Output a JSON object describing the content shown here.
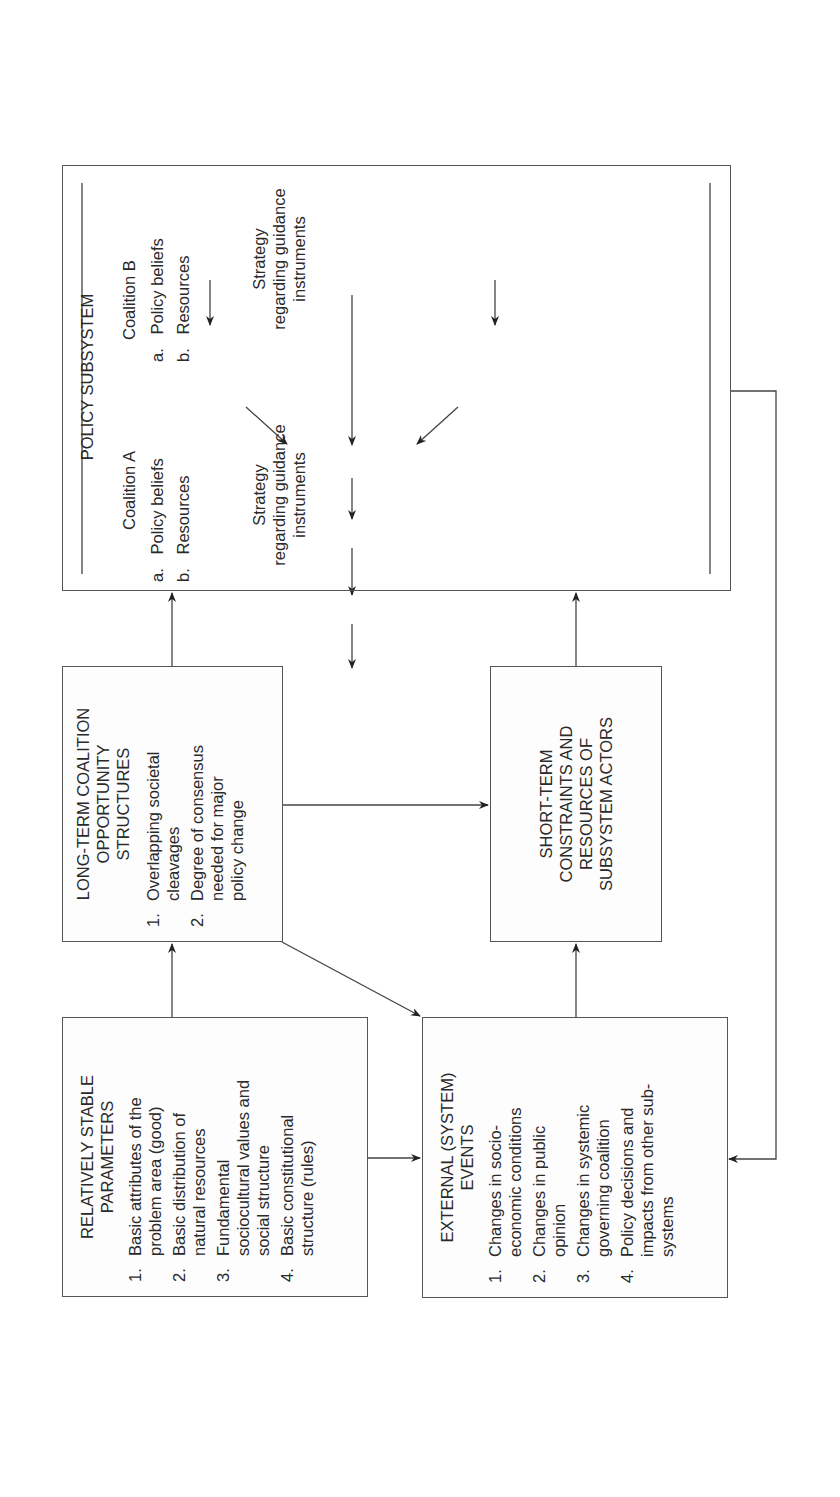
{
  "caption": "2007 Advocacy Coalition Framework Flow Diagram",
  "boxes": {
    "relatively_stable": {
      "title": [
        "RELATIVELY STABLE",
        "PARAMETERS"
      ],
      "items": [
        {
          "num": "1.",
          "lines": [
            "Basic attributes of the",
            "problem area (good)"
          ]
        },
        {
          "num": "2.",
          "lines": [
            "Basic distribution of",
            "natural resources"
          ]
        },
        {
          "num": "3.",
          "lines": [
            "Fundamental",
            "sociocultural values and",
            "social structure"
          ]
        },
        {
          "num": "4.",
          "lines": [
            "Basic constitutional",
            "structure (rules)"
          ]
        }
      ]
    },
    "long_term": {
      "title": [
        "LONG-TERM COALITION",
        "OPPORTUNITY",
        "STRUCTURES"
      ],
      "items": [
        {
          "num": "1.",
          "lines": [
            "Overlapping societal",
            "cleavages"
          ]
        },
        {
          "num": "2.",
          "lines": [
            "Degree of consensus",
            "needed for major",
            "policy change"
          ]
        }
      ]
    },
    "external_events": {
      "title": [
        "EXTERNAL (SYSTEM)",
        "EVENTS"
      ],
      "items": [
        {
          "num": "1.",
          "lines": [
            "Changes in socio-",
            "economic conditions"
          ]
        },
        {
          "num": "2.",
          "lines": [
            "Changes in public",
            "opinion"
          ]
        },
        {
          "num": "3.",
          "lines": [
            "Changes in systemic",
            "governing coalition"
          ]
        },
        {
          "num": "4.",
          "lines": [
            "Policy decisions and",
            "impacts from other sub-",
            "systems"
          ]
        }
      ]
    },
    "short_term": {
      "title": [
        "SHORT-TERM",
        "CONSTRAINTS AND",
        "RESOURCES OF",
        "SUBSYSTEM ACTORS"
      ]
    },
    "policy_subsystem": {
      "title": "POLICY SUBSYSTEM",
      "coalition_a": {
        "label": "Coalition A",
        "items": [
          {
            "num": "a.",
            "text": "Policy beliefs"
          },
          {
            "num": "b.",
            "text": "Resources"
          }
        ],
        "strategy": [
          "Strategy",
          "regarding guidance",
          "instruments"
        ]
      },
      "brokers": [
        "Policy",
        "brokers"
      ],
      "coalition_b": {
        "label": "Coalition B",
        "items": [
          {
            "num": "a.",
            "text": "Policy beliefs"
          },
          {
            "num": "b.",
            "text": "Resources"
          }
        ],
        "strategy": [
          "Strategy",
          "regarding guidance",
          "instruments"
        ]
      },
      "decisions": [
        "Decisions by",
        "governmental authorities"
      ],
      "institutional": [
        "Institutional rules, resource",
        "allocations, and appointments"
      ],
      "outputs": "Policy outputs",
      "impacts": "Policy impacts"
    }
  }
}
